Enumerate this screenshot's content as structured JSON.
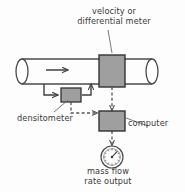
{
  "diagram": {
    "colors": {
      "box_fill": "#9f9f9f",
      "box_stroke": "#333333",
      "pipe_stroke": "#4a4a4a",
      "signal_line": "#555555",
      "text": "#3a3a3a",
      "background": "#fdfdfd"
    },
    "labels": {
      "meter": "velocity or\ndifferential meter",
      "densitometer": "densitometer",
      "computer": "computer",
      "output": "mass flow\nrate output"
    },
    "components": [
      {
        "id": "pipe",
        "name": "process-pipe",
        "kind": "cylinder"
      },
      {
        "id": "flow-arrow",
        "name": "flow-direction-arrow",
        "kind": "arrow"
      },
      {
        "id": "meter-box",
        "name": "velocity-differential-meter",
        "kind": "gray-box"
      },
      {
        "id": "densitometer-box",
        "name": "densitometer",
        "kind": "gray-box"
      },
      {
        "id": "computer-box",
        "name": "computer",
        "kind": "gray-box"
      },
      {
        "id": "gauge",
        "name": "mass-flow-rate-gauge",
        "kind": "dial"
      }
    ],
    "connections": [
      {
        "from": "pipe",
        "to": "densitometer-box",
        "style": "solid"
      },
      {
        "from": "densitometer-box",
        "to": "pipe",
        "style": "solid"
      },
      {
        "from": "meter-box",
        "to": "computer-box",
        "style": "dashed"
      },
      {
        "from": "densitometer-box",
        "to": "computer-box",
        "style": "dashed"
      },
      {
        "from": "computer-box",
        "to": "gauge",
        "style": "dashed"
      }
    ]
  }
}
